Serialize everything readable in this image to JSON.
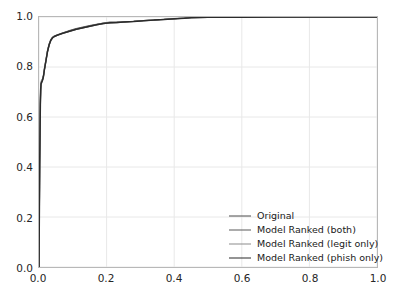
{
  "chart_data": {
    "type": "line",
    "title": "",
    "xlabel": "",
    "ylabel": "",
    "xlim": [
      0.0,
      1.0
    ],
    "ylim": [
      0.0,
      1.0
    ],
    "grid": true,
    "legend_position": "lower right",
    "xticks": [
      "0.0",
      "0.2",
      "0.4",
      "0.6",
      "0.8",
      "1.0"
    ],
    "yticks": [
      "0.0",
      "0.2",
      "0.4",
      "0.6",
      "0.8",
      "1.0"
    ],
    "xtick_values": [
      0.0,
      0.2,
      0.4,
      0.6,
      0.8,
      1.0
    ],
    "ytick_values": [
      0.0,
      0.2,
      0.4,
      0.6,
      0.8,
      1.0
    ],
    "series": [
      {
        "name": "Original",
        "color": "#4d4d4d",
        "width": 1.2,
        "x": [
          0.0,
          0.002,
          0.004,
          0.005,
          0.006,
          0.008,
          0.01,
          0.013,
          0.016,
          0.02,
          0.025,
          0.03,
          0.035,
          0.04,
          0.045,
          0.055,
          0.07,
          0.09,
          0.11,
          0.13,
          0.15,
          0.17,
          0.19,
          0.21,
          0.23,
          0.25,
          0.28,
          0.31,
          0.34,
          0.37,
          0.4,
          0.43,
          0.45,
          0.5,
          0.6,
          0.7,
          0.8,
          0.9,
          1.0
        ],
        "y": [
          0.0,
          0.42,
          0.66,
          0.71,
          0.735,
          0.742,
          0.748,
          0.762,
          0.79,
          0.822,
          0.862,
          0.89,
          0.908,
          0.918,
          0.922,
          0.927,
          0.934,
          0.942,
          0.95,
          0.956,
          0.962,
          0.968,
          0.973,
          0.976,
          0.977,
          0.979,
          0.982,
          0.985,
          0.987,
          0.99,
          0.992,
          0.995,
          0.997,
          0.998,
          0.999,
          0.999,
          1.0,
          1.0,
          1.0
        ]
      },
      {
        "name": "Model Ranked (both)",
        "color": "#5a5a5a",
        "width": 1.2,
        "x": [
          0.0,
          0.002,
          0.004,
          0.005,
          0.006,
          0.008,
          0.01,
          0.013,
          0.016,
          0.02,
          0.025,
          0.03,
          0.035,
          0.04,
          0.045,
          0.055,
          0.07,
          0.09,
          0.11,
          0.13,
          0.15,
          0.17,
          0.19,
          0.21,
          0.23,
          0.25,
          0.28,
          0.31,
          0.34,
          0.37,
          0.4,
          0.43,
          0.45,
          0.5,
          0.6,
          0.7,
          0.8,
          0.9,
          1.0
        ],
        "y": [
          0.0,
          0.4,
          0.64,
          0.705,
          0.728,
          0.738,
          0.745,
          0.76,
          0.788,
          0.82,
          0.86,
          0.888,
          0.906,
          0.916,
          0.921,
          0.928,
          0.936,
          0.946,
          0.954,
          0.96,
          0.966,
          0.971,
          0.976,
          0.98,
          0.98,
          0.981,
          0.983,
          0.986,
          0.988,
          0.991,
          0.993,
          0.996,
          0.998,
          0.999,
          0.999,
          1.0,
          1.0,
          1.0,
          1.0
        ]
      },
      {
        "name": "Model Ranked (legit only)",
        "color": "#8c8c8c",
        "width": 1.2,
        "x": [
          0.0,
          0.002,
          0.004,
          0.005,
          0.006,
          0.008,
          0.01,
          0.013,
          0.016,
          0.02,
          0.025,
          0.03,
          0.035,
          0.04,
          0.045,
          0.055,
          0.07,
          0.09,
          0.11,
          0.13,
          0.15,
          0.17,
          0.19,
          0.21,
          0.23,
          0.25,
          0.28,
          0.31,
          0.34,
          0.37,
          0.4,
          0.43,
          0.45,
          0.5,
          0.6,
          0.7,
          0.8,
          0.9,
          1.0
        ],
        "y": [
          0.0,
          0.43,
          0.67,
          0.722,
          0.742,
          0.748,
          0.752,
          0.766,
          0.794,
          0.826,
          0.864,
          0.892,
          0.91,
          0.92,
          0.924,
          0.929,
          0.936,
          0.944,
          0.952,
          0.958,
          0.964,
          0.97,
          0.975,
          0.978,
          0.979,
          0.98,
          0.983,
          0.986,
          0.988,
          0.991,
          0.993,
          0.996,
          0.998,
          0.999,
          0.999,
          1.0,
          1.0,
          1.0,
          1.0
        ]
      },
      {
        "name": "Model Ranked (phish only)",
        "color": "#2b2b2b",
        "width": 1.5,
        "x": [
          0.0,
          0.002,
          0.004,
          0.005,
          0.006,
          0.008,
          0.01,
          0.013,
          0.016,
          0.02,
          0.025,
          0.03,
          0.035,
          0.04,
          0.045,
          0.055,
          0.07,
          0.09,
          0.11,
          0.13,
          0.15,
          0.17,
          0.19,
          0.21,
          0.23,
          0.25,
          0.28,
          0.31,
          0.34,
          0.37,
          0.4,
          0.43,
          0.45,
          0.5,
          0.6,
          0.7,
          0.8,
          0.9,
          1.0
        ],
        "y": [
          0.0,
          0.41,
          0.65,
          0.712,
          0.732,
          0.74,
          0.746,
          0.761,
          0.789,
          0.821,
          0.861,
          0.889,
          0.907,
          0.917,
          0.922,
          0.928,
          0.935,
          0.943,
          0.951,
          0.957,
          0.963,
          0.969,
          0.974,
          0.977,
          0.978,
          0.98,
          0.982,
          0.985,
          0.988,
          0.99,
          0.993,
          0.995,
          0.997,
          0.999,
          0.999,
          1.0,
          1.0,
          1.0,
          1.0
        ]
      }
    ]
  },
  "axes": {
    "spine_color": "#b8b8b8",
    "grid_color": "#e8e8e8",
    "background": "#ffffff"
  }
}
